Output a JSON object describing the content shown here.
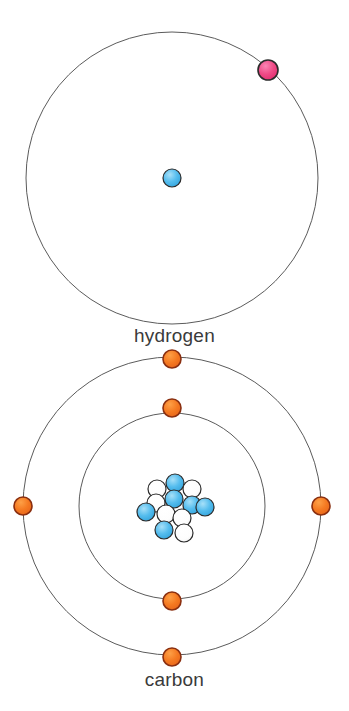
{
  "diagram": {
    "background_color": "#ffffff",
    "atoms": [
      {
        "id": "hydrogen",
        "label": "hydrogen",
        "label_position": {
          "x": 174,
          "y": 339
        },
        "center": {
          "x": 172,
          "y": 178
        },
        "nucleus": {
          "type": "single-proton",
          "particles": [
            {
              "kind": "proton",
              "color": "#4fb8ec",
              "x": 172,
              "y": 178,
              "r": 9
            }
          ]
        },
        "shells": [
          {
            "index": 1,
            "radius": 146,
            "stroke_color": "#5b5b5b",
            "stroke_width": 1,
            "electron_count": 1,
            "electrons": [
              {
                "x": 268,
                "y": 70,
                "r": 10,
                "color": "#ef4a86",
                "outline": "#2b2b2b"
              }
            ]
          }
        ]
      },
      {
        "id": "carbon",
        "label": "carbon",
        "label_position": {
          "x": 174,
          "y": 683
        },
        "center": {
          "x": 172,
          "y": 506
        },
        "nucleus": {
          "type": "nucleon-cluster",
          "proton_color": "#4fb8ec",
          "neutron_color": "#ffffff",
          "proton_count": 6,
          "neutron_count": 6,
          "particles": [
            {
              "kind": "proton",
              "color": "#4fb8ec",
              "x": 175,
              "y": 483,
              "r": 9
            },
            {
              "kind": "neutron",
              "color": "#ffffff",
              "x": 157,
              "y": 489,
              "r": 9
            },
            {
              "kind": "neutron",
              "color": "#ffffff",
              "x": 192,
              "y": 489,
              "r": 9
            },
            {
              "kind": "proton",
              "color": "#4fb8ec",
              "x": 174,
              "y": 499,
              "r": 9
            },
            {
              "kind": "neutron",
              "color": "#ffffff",
              "x": 156,
              "y": 503,
              "r": 9
            },
            {
              "kind": "proton",
              "color": "#4fb8ec",
              "x": 192,
              "y": 505,
              "r": 9
            },
            {
              "kind": "proton",
              "color": "#4fb8ec",
              "x": 146,
              "y": 512,
              "r": 9
            },
            {
              "kind": "neutron",
              "color": "#ffffff",
              "x": 166,
              "y": 514,
              "r": 9
            },
            {
              "kind": "proton",
              "color": "#4fb8ec",
              "x": 205,
              "y": 507,
              "r": 9
            },
            {
              "kind": "neutron",
              "color": "#ffffff",
              "x": 182,
              "y": 518,
              "r": 9
            },
            {
              "kind": "proton",
              "color": "#4fb8ec",
              "x": 164,
              "y": 530,
              "r": 9
            },
            {
              "kind": "neutron",
              "color": "#ffffff",
              "x": 184,
              "y": 533,
              "r": 9
            }
          ]
        },
        "shells": [
          {
            "index": 1,
            "radius": 93,
            "stroke_color": "#5b5b5b",
            "stroke_width": 1,
            "electron_count": 2,
            "electrons": [
              {
                "x": 172,
                "y": 408,
                "r": 9,
                "color": "#f57a22",
                "outline": "#8a2f10"
              },
              {
                "x": 172,
                "y": 601,
                "r": 9,
                "color": "#f57a22",
                "outline": "#8a2f10"
              }
            ]
          },
          {
            "index": 2,
            "radius": 149,
            "stroke_color": "#5b5b5b",
            "stroke_width": 1,
            "electron_count": 4,
            "electrons": [
              {
                "x": 172,
                "y": 359,
                "r": 9,
                "color": "#f57a22",
                "outline": "#8a2f10"
              },
              {
                "x": 23,
                "y": 506,
                "r": 9,
                "color": "#f57a22",
                "outline": "#8a2f10"
              },
              {
                "x": 321,
                "y": 506,
                "r": 9,
                "color": "#f57a22",
                "outline": "#8a2f10"
              },
              {
                "x": 172,
                "y": 657,
                "r": 9,
                "color": "#f57a22",
                "outline": "#8a2f10"
              }
            ]
          }
        ]
      }
    ],
    "colors": {
      "proton": "#4fb8ec",
      "neutron": "#ffffff",
      "hydrogen_electron": "#ef4a86",
      "carbon_electron": "#f57a22",
      "orbit_stroke": "#5b5b5b",
      "label_text": "#3a3a3a",
      "nucleon_outline": "#2b2b2b"
    }
  }
}
